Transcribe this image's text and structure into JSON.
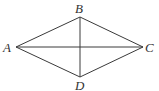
{
  "diagram": {
    "type": "rhombus-with-diagonals",
    "vertices": {
      "A": {
        "label": "A",
        "x": 16,
        "y": 47
      },
      "B": {
        "label": "B",
        "x": 80,
        "y": 17
      },
      "C": {
        "label": "C",
        "x": 143,
        "y": 47
      },
      "D": {
        "label": "D",
        "x": 80,
        "y": 77
      }
    },
    "edges": [
      [
        "A",
        "B"
      ],
      [
        "B",
        "C"
      ],
      [
        "C",
        "D"
      ],
      [
        "D",
        "A"
      ]
    ],
    "diagonals": [
      [
        "A",
        "C"
      ],
      [
        "B",
        "D"
      ]
    ],
    "line_color": "#3a3a3a",
    "label_color": "#333333"
  }
}
